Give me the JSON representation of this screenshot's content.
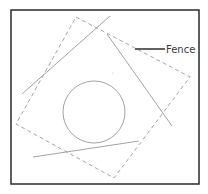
{
  "diagram": {
    "width": 208,
    "height": 194,
    "colors": {
      "background": "#ffffff",
      "frame": "#2a2a2a",
      "geometry": "#8a8a8a",
      "fence": "#9a9a9a",
      "leader": "#3a3a3a",
      "label": "#3a3a3a"
    },
    "frame": {
      "x": 11,
      "y": 10,
      "width": 188,
      "height": 174
    },
    "fence": {
      "label": "Fence",
      "points": "76,17 190,77 114,178 16,124",
      "style": "dashed"
    },
    "leader": {
      "x1": 135,
      "y1": 49,
      "x2": 165,
      "y2": 49
    },
    "label_position": {
      "x": 166,
      "y": 53
    },
    "lines": [
      {
        "id": "line-1",
        "x1": 22,
        "y1": 94,
        "x2": 110,
        "y2": 16
      },
      {
        "id": "line-2",
        "x1": 107,
        "y1": 34,
        "x2": 172,
        "y2": 126
      },
      {
        "id": "line-3",
        "x1": 33,
        "y1": 157,
        "x2": 139,
        "y2": 141
      }
    ],
    "circle": {
      "cx": 94,
      "cy": 112,
      "r": 31
    },
    "dot": {
      "cx": 113,
      "cy": 73
    }
  }
}
